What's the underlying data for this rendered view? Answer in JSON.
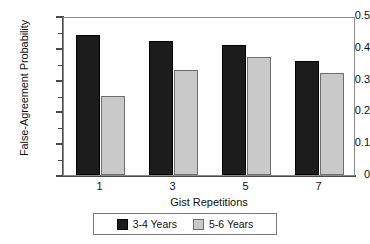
{
  "chart_data": {
    "type": "bar",
    "title": "",
    "xlabel": "Gist Repetitions",
    "ylabel": "False-Agreement Probability",
    "categories": [
      "1",
      "3",
      "5",
      "7"
    ],
    "series": [
      {
        "name": "3-4 Years",
        "values": [
          0.44,
          0.42,
          0.41,
          0.36
        ],
        "color": "#1c1c1c"
      },
      {
        "name": "5-6 Years",
        "values": [
          0.25,
          0.33,
          0.37,
          0.32
        ],
        "color": "#c9c9c9"
      }
    ],
    "ylim": [
      0,
      0.5
    ],
    "ytick_values": [
      0,
      0.1,
      0.2,
      0.3,
      0.4,
      0.5
    ],
    "ytick_labels": [
      "0",
      "0.1",
      "0.2",
      "0.3",
      "0.4",
      "0.5"
    ],
    "yminor_values": [
      0.05,
      0.15,
      0.25,
      0.35,
      0.45
    ],
    "grid": false,
    "legend_position": "bottom-center"
  }
}
